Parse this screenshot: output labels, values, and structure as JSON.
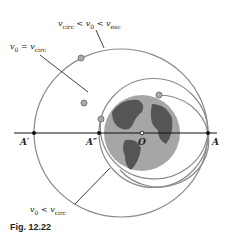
{
  "labels": {
    "elliptic_outer": {
      "v": "v",
      "sub0": "circ",
      "lt1": " < v",
      "sub1": "0",
      "lt2": " < v",
      "sub2": "esc"
    },
    "circular": {
      "a": "v",
      "sub0": "0",
      "eq": " = v",
      "sub1": "circ"
    },
    "elliptic_inner": {
      "a": "v",
      "sub0": "0",
      "lt": " < v",
      "sub1": "circ"
    }
  },
  "points": {
    "A": "A",
    "A_prime": "A′",
    "A_double_prime": "A″",
    "O": "O"
  },
  "caption": "Fig. 12.22",
  "colors": {
    "orbit": "#8a8a8a",
    "earth": "#9a9a9a",
    "land": "#555555",
    "line": "#111111"
  }
}
